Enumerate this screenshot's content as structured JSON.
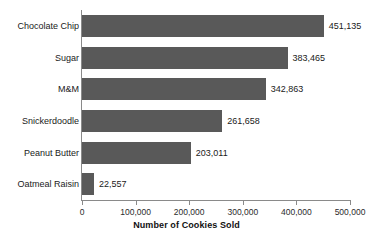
{
  "chart_data": {
    "type": "bar",
    "orientation": "horizontal",
    "title": "March Cookie Sales",
    "xlabel": "Number of Cookies Sold",
    "ylabel": "",
    "categories": [
      "Chocolate Chip",
      "Sugar",
      "M&M",
      "Snickerdoodle",
      "Peanut Butter",
      "Oatmeal Raisin"
    ],
    "values": [
      451135,
      383465,
      342863,
      261658,
      203011,
      22557
    ],
    "value_labels": [
      "451,135",
      "383,465",
      "342,863",
      "261,658",
      "203,011",
      "22,557"
    ],
    "xlim": [
      0,
      500000
    ],
    "xticks": [
      0,
      100000,
      200000,
      300000,
      400000,
      500000
    ],
    "xtick_labels": [
      "0",
      "100,000",
      "200,000",
      "300,000",
      "400,000",
      "500,000"
    ],
    "grid": false,
    "legend": null,
    "bar_color": "#595959",
    "axis_color": "#8a8a8a",
    "text_color": "#1a1a1a"
  }
}
